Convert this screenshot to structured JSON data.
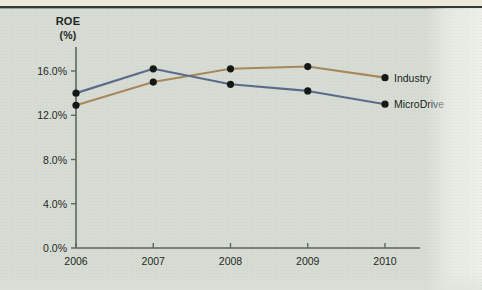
{
  "figure": {
    "y_axis_title": "ROE",
    "y_axis_unit": "(%)"
  },
  "chart_data": {
    "type": "line",
    "title": "ROE (%)",
    "xlabel": "",
    "ylabel": "ROE (%)",
    "categories": [
      "2006",
      "2007",
      "2008",
      "2009",
      "2010"
    ],
    "x_tick_labels": [
      "2006",
      "2007",
      "2008",
      "2009",
      "2010"
    ],
    "y_tick_labels": [
      "0.0%",
      "4.0%",
      "8.0%",
      "12.0%",
      "16.0%"
    ],
    "y_tick_values": [
      0.0,
      4.0,
      8.0,
      12.0,
      16.0
    ],
    "ylim": [
      0.0,
      18.0
    ],
    "grid": false,
    "legend_position": "inline-right",
    "series": [
      {
        "name": "Industry",
        "color": "#a8875c",
        "values": [
          12.9,
          15.0,
          16.2,
          16.4,
          15.4
        ]
      },
      {
        "name": "MicroDrive",
        "color": "#5a6a8a",
        "values": [
          14.0,
          16.2,
          14.8,
          14.2,
          13.0
        ]
      }
    ],
    "marker": "filled-circle",
    "marker_color": "#121716"
  }
}
